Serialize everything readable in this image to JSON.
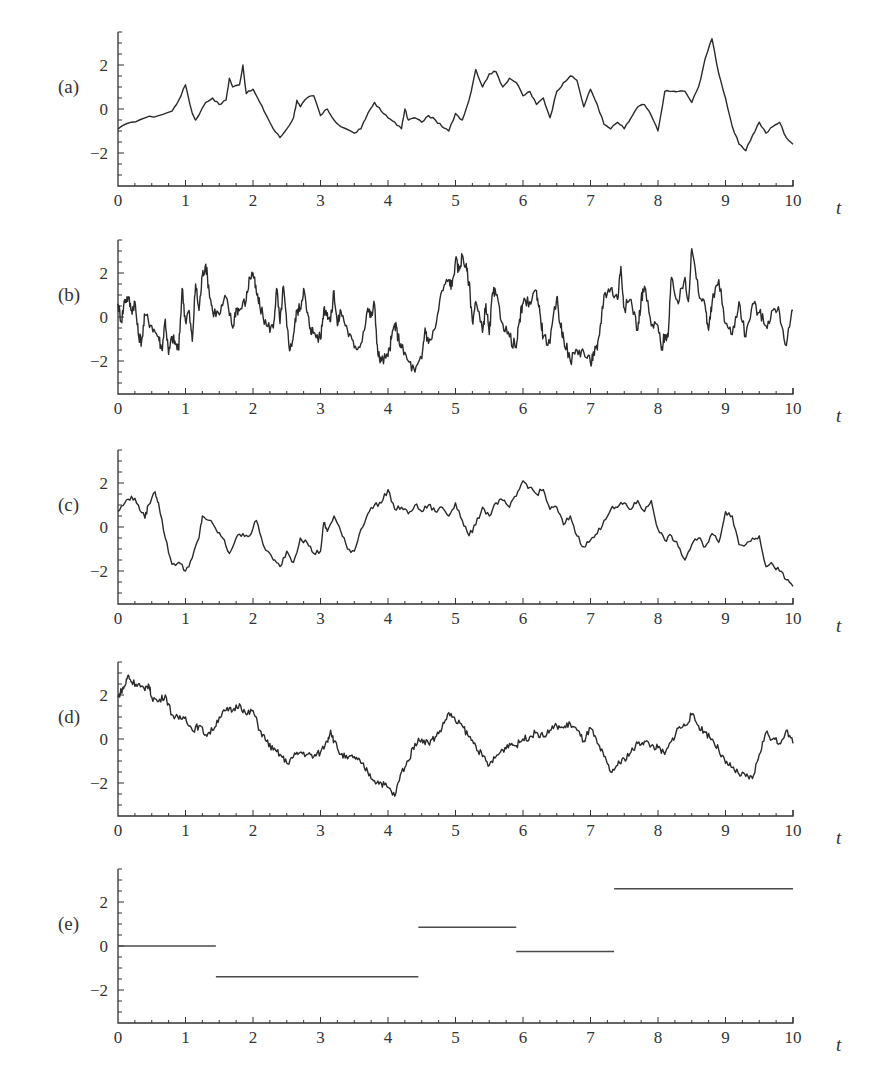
{
  "figure": {
    "x_axis_title": "t",
    "x_ticks": [
      0,
      1,
      2,
      3,
      4,
      5,
      6,
      7,
      8,
      9,
      10
    ],
    "y_ticks": [
      2,
      0,
      -2
    ],
    "y_tick_labels": [
      "2",
      "0",
      "−2"
    ],
    "ylim": [
      -3.5,
      3.5
    ],
    "xlim": [
      0,
      10
    ],
    "line_color": "#2a2a2a"
  },
  "chart_data": [
    {
      "panel": "(a)",
      "type": "line",
      "title": "",
      "xlabel": "t",
      "ylabel": "",
      "xlim": [
        0,
        10
      ],
      "ylim": [
        -3.5,
        3.5
      ],
      "grid": false,
      "x": [
        0,
        0.2,
        0.4,
        0.6,
        0.8,
        0.9,
        1.0,
        1.1,
        1.15,
        1.3,
        1.4,
        1.5,
        1.6,
        1.65,
        1.7,
        1.8,
        1.85,
        1.9,
        2.0,
        2.1,
        2.2,
        2.3,
        2.4,
        2.5,
        2.6,
        2.65,
        2.7,
        2.8,
        2.9,
        3.0,
        3.1,
        3.2,
        3.3,
        3.5,
        3.6,
        3.7,
        3.8,
        3.9,
        4.0,
        4.1,
        4.2,
        4.25,
        4.3,
        4.4,
        4.5,
        4.6,
        4.7,
        4.8,
        4.9,
        5.0,
        5.1,
        5.2,
        5.3,
        5.4,
        5.5,
        5.6,
        5.7,
        5.8,
        5.9,
        6.0,
        6.1,
        6.2,
        6.3,
        6.4,
        6.5,
        6.6,
        6.7,
        6.8,
        6.9,
        7.0,
        7.1,
        7.2,
        7.3,
        7.4,
        7.5,
        7.6,
        7.7,
        7.8,
        7.9,
        8.0,
        8.1,
        8.2,
        8.3,
        8.4,
        8.5,
        8.6,
        8.7,
        8.8,
        8.9,
        9.0,
        9.1,
        9.2,
        9.3,
        9.4,
        9.5,
        9.6,
        9.7,
        9.8,
        9.9,
        10.0
      ],
      "values": [
        -0.9,
        -0.6,
        -0.4,
        -0.3,
        -0.1,
        0.4,
        1.1,
        -0.2,
        -0.5,
        0.3,
        0.5,
        0.2,
        0.4,
        1.4,
        1.0,
        1.1,
        2.0,
        0.7,
        0.9,
        0.3,
        -0.3,
        -0.9,
        -1.3,
        -0.9,
        -0.4,
        0.4,
        0.1,
        0.5,
        0.6,
        -0.3,
        0.0,
        -0.5,
        -0.8,
        -1.1,
        -0.9,
        -0.2,
        0.3,
        -0.1,
        -0.4,
        -0.6,
        -0.9,
        0.0,
        -0.5,
        -0.4,
        -0.6,
        -0.3,
        -0.5,
        -0.8,
        -1.0,
        -0.2,
        -0.5,
        0.4,
        1.8,
        1.0,
        1.6,
        1.7,
        1.0,
        1.4,
        1.2,
        0.6,
        0.8,
        0.2,
        0.5,
        -0.4,
        0.8,
        1.2,
        1.5,
        1.3,
        0.1,
        0.9,
        0.2,
        -0.7,
        -0.9,
        -0.6,
        -0.9,
        -0.4,
        0.1,
        0.2,
        -0.3,
        -1.0,
        0.8,
        0.8,
        0.8,
        0.8,
        0.3,
        1.0,
        2.3,
        3.2,
        1.6,
        0.5,
        -0.8,
        -1.6,
        -1.9,
        -1.2,
        -0.6,
        -1.1,
        -0.8,
        -0.6,
        -1.3,
        -1.6
      ]
    },
    {
      "panel": "(b)",
      "type": "line",
      "title": "",
      "xlabel": "t",
      "ylabel": "",
      "xlim": [
        0,
        10
      ],
      "ylim": [
        -3.5,
        3.5
      ],
      "grid": false,
      "x": [
        0,
        0.05,
        0.1,
        0.15,
        0.2,
        0.25,
        0.3,
        0.35,
        0.4,
        0.5,
        0.6,
        0.65,
        0.7,
        0.75,
        0.8,
        0.85,
        0.9,
        0.95,
        1.0,
        1.05,
        1.1,
        1.15,
        1.2,
        1.25,
        1.3,
        1.35,
        1.4,
        1.5,
        1.6,
        1.7,
        1.75,
        1.8,
        1.9,
        1.95,
        2.0,
        2.05,
        2.1,
        2.2,
        2.3,
        2.35,
        2.4,
        2.45,
        2.5,
        2.55,
        2.6,
        2.65,
        2.7,
        2.75,
        2.8,
        2.85,
        2.9,
        3.0,
        3.05,
        3.1,
        3.15,
        3.2,
        3.25,
        3.3,
        3.4,
        3.5,
        3.6,
        3.7,
        3.75,
        3.8,
        3.85,
        3.9,
        4.0,
        4.05,
        4.1,
        4.15,
        4.2,
        4.3,
        4.4,
        4.5,
        4.55,
        4.6,
        4.7,
        4.8,
        4.9,
        4.95,
        5.0,
        5.05,
        5.1,
        5.15,
        5.2,
        5.25,
        5.3,
        5.4,
        5.45,
        5.5,
        5.55,
        5.6,
        5.7,
        5.8,
        5.9,
        5.95,
        6.0,
        6.1,
        6.2,
        6.25,
        6.3,
        6.4,
        6.5,
        6.55,
        6.6,
        6.7,
        6.8,
        6.9,
        7.0,
        7.05,
        7.1,
        7.15,
        7.2,
        7.3,
        7.4,
        7.45,
        7.5,
        7.6,
        7.7,
        7.75,
        7.8,
        7.9,
        8.0,
        8.05,
        8.1,
        8.15,
        8.2,
        8.3,
        8.4,
        8.45,
        8.5,
        8.6,
        8.7,
        8.75,
        8.8,
        8.9,
        9.0,
        9.1,
        9.2,
        9.3,
        9.4,
        9.5,
        9.6,
        9.7,
        9.8,
        9.9,
        10.0
      ],
      "values": [
        0.6,
        -0.2,
        0.8,
        0.9,
        0.3,
        0.7,
        -0.8,
        -1.1,
        0.1,
        -0.4,
        -0.9,
        -1.5,
        -0.1,
        -1.7,
        -0.9,
        -1.2,
        -1.5,
        1.3,
        -0.2,
        0.3,
        -1.1,
        1.5,
        0.3,
        1.9,
        2.4,
        1.2,
        0.3,
        0.1,
        0.9,
        -0.5,
        0.4,
        0.3,
        0.8,
        1.8,
        2.0,
        1.1,
        0.5,
        -0.4,
        -0.5,
        1.3,
        -0.3,
        1.4,
        -0.4,
        -1.5,
        -0.8,
        0.3,
        0.4,
        1.3,
        0.2,
        -0.5,
        -0.7,
        -1.0,
        0.4,
        0.2,
        -0.2,
        1.2,
        -0.4,
        0.3,
        -0.6,
        -1.4,
        -1.2,
        0.4,
        0.0,
        0.6,
        -1.7,
        -2.0,
        -1.8,
        -1.0,
        -0.3,
        -0.9,
        -1.4,
        -2.0,
        -2.5,
        -1.9,
        -0.5,
        -1.2,
        -0.5,
        1.2,
        1.7,
        1.4,
        2.6,
        2.1,
        2.8,
        2.3,
        1.6,
        -0.2,
        0.7,
        -0.7,
        0.6,
        -0.8,
        1.1,
        1.0,
        -0.3,
        -0.9,
        -1.4,
        -0.1,
        0.6,
        0.7,
        1.2,
        0.2,
        -0.9,
        -1.2,
        0.9,
        -0.3,
        -0.9,
        -2.0,
        -1.5,
        -1.6,
        -2.1,
        -1.6,
        -1.5,
        -0.3,
        1.0,
        1.3,
        0.8,
        2.3,
        0.4,
        0.8,
        -0.6,
        0.8,
        1.4,
        -0.4,
        -0.4,
        -1.5,
        -0.8,
        -0.9,
        1.8,
        0.6,
        1.8,
        0.7,
        3.1,
        1.1,
        0.5,
        -0.6,
        0.6,
        1.7,
        -0.3,
        -0.8,
        0.7,
        -0.9,
        0.6,
        0.2,
        -0.4,
        0.3,
        0.2,
        -1.3,
        0.3,
        -0.2,
        -0.6,
        -1.6
      ]
    },
    {
      "panel": "(c)",
      "type": "line",
      "title": "",
      "xlabel": "t",
      "ylabel": "",
      "xlim": [
        0,
        10
      ],
      "ylim": [
        -3.5,
        3.5
      ],
      "grid": false,
      "x": [
        0,
        0.1,
        0.2,
        0.3,
        0.4,
        0.45,
        0.55,
        0.6,
        0.7,
        0.8,
        0.9,
        1.0,
        1.1,
        1.2,
        1.25,
        1.35,
        1.45,
        1.55,
        1.65,
        1.75,
        1.85,
        1.95,
        2.05,
        2.15,
        2.3,
        2.4,
        2.5,
        2.6,
        2.7,
        2.8,
        2.9,
        3.0,
        3.05,
        3.1,
        3.2,
        3.3,
        3.4,
        3.5,
        3.6,
        3.7,
        3.8,
        3.9,
        4.0,
        4.1,
        4.2,
        4.3,
        4.4,
        4.5,
        4.6,
        4.7,
        4.8,
        4.9,
        5.0,
        5.1,
        5.2,
        5.3,
        5.4,
        5.5,
        5.6,
        5.7,
        5.8,
        5.9,
        6.0,
        6.1,
        6.2,
        6.3,
        6.4,
        6.5,
        6.6,
        6.7,
        6.8,
        6.9,
        7.0,
        7.1,
        7.2,
        7.3,
        7.4,
        7.5,
        7.6,
        7.7,
        7.8,
        7.9,
        8.0,
        8.1,
        8.2,
        8.3,
        8.4,
        8.5,
        8.6,
        8.7,
        8.8,
        8.9,
        9.0,
        9.1,
        9.2,
        9.3,
        9.4,
        9.5,
        9.6,
        9.7,
        9.8,
        9.9,
        10.0
      ],
      "values": [
        0.7,
        1.1,
        1.4,
        1.0,
        0.4,
        1.0,
        1.6,
        1.1,
        -0.5,
        -1.7,
        -1.6,
        -2.0,
        -1.4,
        -0.5,
        0.5,
        0.3,
        -0.1,
        -0.5,
        -1.2,
        -0.5,
        -0.3,
        -0.4,
        0.3,
        -0.8,
        -1.5,
        -1.8,
        -1.1,
        -1.6,
        -0.5,
        -0.7,
        -1.2,
        -1.1,
        0.2,
        -0.2,
        0.5,
        -0.2,
        -1.0,
        -1.1,
        -0.1,
        0.6,
        1.0,
        1.1,
        1.7,
        0.8,
        0.9,
        0.6,
        1.0,
        0.7,
        1.0,
        0.7,
        0.9,
        0.5,
        1.1,
        0.3,
        -0.4,
        0.1,
        0.9,
        0.5,
        1.1,
        1.2,
        0.9,
        1.4,
        2.1,
        1.8,
        1.5,
        1.7,
        0.8,
        0.9,
        0.1,
        0.5,
        -0.4,
        -0.9,
        -0.6,
        -0.3,
        0.3,
        0.8,
        0.9,
        1.1,
        0.8,
        1.2,
        0.7,
        1.2,
        -0.1,
        -0.6,
        -0.4,
        -0.9,
        -1.5,
        -0.8,
        -0.5,
        -0.9,
        -0.3,
        -0.7,
        0.7,
        0.5,
        -0.8,
        -0.8,
        -0.5,
        -0.4,
        -1.8,
        -1.7,
        -2.0,
        -2.4,
        -2.7
      ]
    },
    {
      "panel": "(d)",
      "type": "line",
      "title": "",
      "xlabel": "t",
      "ylabel": "",
      "xlim": [
        0,
        10
      ],
      "ylim": [
        -3.5,
        3.5
      ],
      "grid": false,
      "x": [
        0,
        0.05,
        0.1,
        0.15,
        0.2,
        0.3,
        0.4,
        0.45,
        0.5,
        0.6,
        0.7,
        0.8,
        0.9,
        1.0,
        1.1,
        1.2,
        1.3,
        1.4,
        1.5,
        1.6,
        1.7,
        1.8,
        1.9,
        2.0,
        2.1,
        2.2,
        2.3,
        2.4,
        2.5,
        2.6,
        2.7,
        2.8,
        2.9,
        3.0,
        3.1,
        3.15,
        3.2,
        3.3,
        3.4,
        3.5,
        3.6,
        3.7,
        3.8,
        3.9,
        4.0,
        4.1,
        4.2,
        4.3,
        4.4,
        4.5,
        4.6,
        4.7,
        4.8,
        4.9,
        5.0,
        5.1,
        5.2,
        5.3,
        5.4,
        5.5,
        5.6,
        5.7,
        5.8,
        5.9,
        6.0,
        6.1,
        6.2,
        6.3,
        6.4,
        6.5,
        6.6,
        6.7,
        6.8,
        6.9,
        7.0,
        7.1,
        7.2,
        7.3,
        7.4,
        7.5,
        7.6,
        7.7,
        7.8,
        7.9,
        8.0,
        8.1,
        8.2,
        8.3,
        8.4,
        8.5,
        8.6,
        8.7,
        8.8,
        8.9,
        9.0,
        9.1,
        9.2,
        9.3,
        9.4,
        9.5,
        9.6,
        9.7,
        9.8,
        9.9,
        10.0
      ],
      "values": [
        1.9,
        2.2,
        2.4,
        2.9,
        2.6,
        2.5,
        2.2,
        2.5,
        1.9,
        1.7,
        2.0,
        1.1,
        0.9,
        1.0,
        0.4,
        0.6,
        0.2,
        0.4,
        1.0,
        1.3,
        1.3,
        1.6,
        1.1,
        1.3,
        0.4,
        -0.1,
        -0.5,
        -0.7,
        -1.1,
        -0.8,
        -0.6,
        -0.7,
        -0.8,
        -0.6,
        -0.1,
        0.4,
        -0.1,
        -0.7,
        -0.9,
        -0.8,
        -1.1,
        -1.5,
        -1.9,
        -2.0,
        -2.2,
        -2.6,
        -1.5,
        -1.0,
        -0.2,
        0.0,
        -0.2,
        0.1,
        0.5,
        1.2,
        0.8,
        0.6,
        0.1,
        -0.3,
        -0.8,
        -1.2,
        -0.8,
        -0.5,
        -0.2,
        -0.3,
        0.0,
        0.1,
        0.3,
        0.1,
        0.4,
        0.6,
        0.5,
        0.7,
        0.4,
        -0.1,
        0.5,
        -0.2,
        -0.8,
        -1.5,
        -1.2,
        -0.9,
        -0.6,
        -0.2,
        -0.1,
        -0.3,
        -0.4,
        -0.7,
        -0.1,
        0.5,
        0.6,
        1.1,
        0.6,
        0.3,
        0.0,
        -0.5,
        -1.1,
        -1.3,
        -1.6,
        -1.7,
        -1.8,
        -0.7,
        0.3,
        0.0,
        -0.2,
        0.4,
        -0.2
      ]
    },
    {
      "panel": "(e)",
      "type": "line",
      "subtype": "piecewise-constant",
      "title": "",
      "xlabel": "t",
      "ylabel": "",
      "xlim": [
        0,
        10
      ],
      "ylim": [
        -3.5,
        3.5
      ],
      "grid": false,
      "segments": [
        {
          "t_start": 0.0,
          "t_end": 1.45,
          "value": 0.0
        },
        {
          "t_start": 1.45,
          "t_end": 4.45,
          "value": -1.4
        },
        {
          "t_start": 4.45,
          "t_end": 5.9,
          "value": 0.85
        },
        {
          "t_start": 5.9,
          "t_end": 7.35,
          "value": -0.25
        },
        {
          "t_start": 7.35,
          "t_end": 10.0,
          "value": 2.6
        }
      ]
    }
  ],
  "panels": [
    {
      "label": "(a)",
      "top": 32
    },
    {
      "label": "(b)",
      "top": 240
    },
    {
      "label": "(c)",
      "top": 450
    },
    {
      "label": "(d)",
      "top": 662
    },
    {
      "label": "(e)",
      "top": 869
    }
  ]
}
